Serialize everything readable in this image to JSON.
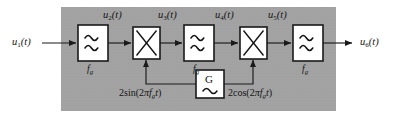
{
  "figure": {
    "type": "block-diagram",
    "background_color": "#a6a6a6",
    "line_color": "#1a1a1a",
    "block_fill": "#ffffff"
  },
  "signals": {
    "input": {
      "name": "u1",
      "base": "u",
      "sub": "1",
      "arg": "(t)",
      "text": "u₁(t)"
    },
    "s2": {
      "name": "u2",
      "base": "u",
      "sub": "2",
      "arg": "(t)",
      "text": "u₂(t)"
    },
    "s3": {
      "name": "u3",
      "base": "u",
      "sub": "3",
      "arg": "(t)",
      "text": "u₃(t)"
    },
    "s4": {
      "name": "u4",
      "base": "u",
      "sub": "4",
      "arg": "(t)",
      "text": "u₄(t)"
    },
    "s5": {
      "name": "u5",
      "base": "u",
      "sub": "5",
      "arg": "(t)",
      "text": "u₅(t)"
    },
    "output": {
      "name": "u6",
      "base": "u",
      "sub": "6",
      "arg": "(t)",
      "text": "u₆(t)"
    }
  },
  "blocks": {
    "filter1": {
      "kind": "filter",
      "glyph": "≋",
      "icon": "wave-filter-icon",
      "label_base": "f",
      "label_sub": "g"
    },
    "mixer1": {
      "kind": "multiplier",
      "glyph": "×",
      "icon": "multiply-icon"
    },
    "filter2": {
      "kind": "filter",
      "glyph": "≋",
      "icon": "wave-filter-icon",
      "label_base": "f",
      "label_sub": "g"
    },
    "mixer2": {
      "kind": "multiplier",
      "glyph": "×",
      "icon": "multiply-icon"
    },
    "filter3": {
      "kind": "filter",
      "glyph": "≋",
      "icon": "wave-filter-icon",
      "label_base": "f",
      "label_sub": "g"
    },
    "generator": {
      "kind": "oscillator",
      "letter": "G",
      "wave_glyph": "∼",
      "icon": "sine-generator-icon"
    }
  },
  "carriers": {
    "sine": {
      "prefix": "2sin(2",
      "pi": "π",
      "f": "f",
      "f_sub": "g",
      "t": "t",
      "suffix": ")",
      "text": "2sin(2πfᵍ t)"
    },
    "cosine": {
      "prefix": "2cos(2",
      "pi": "π",
      "f": "f",
      "f_sub": "g",
      "t": "t",
      "suffix": ")",
      "text": "2cos(2πfᵍ t)"
    }
  }
}
